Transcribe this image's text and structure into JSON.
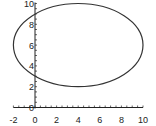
{
  "chart_data": {
    "type": "line",
    "title": "",
    "xlabel": "",
    "ylabel": "",
    "xlim": [
      -2,
      10
    ],
    "ylim": [
      0,
      10
    ],
    "grid": false,
    "legend": null,
    "x_ticks": [
      "-2",
      "0",
      "2",
      "4",
      "6",
      "8",
      "10"
    ],
    "y_ticks": [
      "0",
      "2",
      "4",
      "6",
      "8",
      "10"
    ],
    "series": [
      {
        "name": "ellipse",
        "shape": "ellipse",
        "center": [
          4,
          6
        ],
        "semi_axis_x": 6,
        "semi_axis_y": 4,
        "equation": "(x-4)^2/36 + (y-6)^2/16 = 1",
        "x": [
          -2,
          -1,
          0,
          1,
          2,
          3,
          4,
          5,
          6,
          7,
          8,
          9,
          10,
          9,
          8,
          7,
          6,
          5,
          4,
          3,
          2,
          1,
          0,
          -1,
          -2
        ],
        "y": [
          6,
          8.21,
          8.98,
          9.46,
          9.77,
          9.94,
          10,
          9.94,
          9.77,
          9.46,
          8.98,
          8.21,
          6,
          3.79,
          3.02,
          2.54,
          2.23,
          2.06,
          2,
          2.06,
          2.23,
          2.54,
          3.02,
          3.79,
          6
        ]
      }
    ],
    "annotations": []
  },
  "axes": {
    "x_tick_labels": [
      "-2",
      "0",
      "2",
      "4",
      "6",
      "8",
      "10"
    ],
    "y_tick_labels": [
      "10",
      "8",
      "6",
      "4",
      "2",
      "0"
    ]
  },
  "colors": {
    "line": "#333333",
    "axis": "#222222",
    "background": "#ffffff"
  }
}
